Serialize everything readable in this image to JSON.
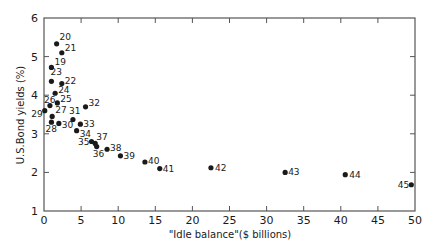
{
  "chart_data": {
    "type": "scatter",
    "title": "",
    "xlabel": "\"Idle balance\"($ billions)",
    "ylabel": "U.S.Bond yields (%)",
    "xlim": [
      0,
      50
    ],
    "ylim": [
      1,
      6
    ],
    "xticks": [
      0,
      5,
      10,
      15,
      20,
      25,
      30,
      35,
      40,
      45,
      50
    ],
    "yticks": [
      1,
      2,
      3,
      4,
      5,
      6
    ],
    "grid": false,
    "legend": null,
    "series": [
      {
        "name": "Observations (labelled by year)",
        "points": [
          {
            "label": "19",
            "x": 1.0,
            "y": 4.72
          },
          {
            "label": "20",
            "x": 1.7,
            "y": 5.33
          },
          {
            "label": "21",
            "x": 2.4,
            "y": 5.1
          },
          {
            "label": "22",
            "x": 2.4,
            "y": 4.3
          },
          {
            "label": "23",
            "x": 1.0,
            "y": 4.36
          },
          {
            "label": "24",
            "x": 1.5,
            "y": 4.05
          },
          {
            "label": "25",
            "x": 1.8,
            "y": 3.8
          },
          {
            "label": "26",
            "x": 0.8,
            "y": 3.73
          },
          {
            "label": "27",
            "x": 1.1,
            "y": 3.45
          },
          {
            "label": "28",
            "x": 1.0,
            "y": 3.3
          },
          {
            "label": "29",
            "x": 0.1,
            "y": 3.6
          },
          {
            "label": "30",
            "x": 2.0,
            "y": 3.27
          },
          {
            "label": "31",
            "x": 3.9,
            "y": 3.37
          },
          {
            "label": "32",
            "x": 5.6,
            "y": 3.7
          },
          {
            "label": "33",
            "x": 4.9,
            "y": 3.25
          },
          {
            "label": "34",
            "x": 4.4,
            "y": 3.08
          },
          {
            "label": "35",
            "x": 6.4,
            "y": 2.8
          },
          {
            "label": "36",
            "x": 7.1,
            "y": 2.67
          },
          {
            "label": "37",
            "x": 6.9,
            "y": 2.75
          },
          {
            "label": "38",
            "x": 8.5,
            "y": 2.6
          },
          {
            "label": "39",
            "x": 10.3,
            "y": 2.43
          },
          {
            "label": "40",
            "x": 13.6,
            "y": 2.27
          },
          {
            "label": "41",
            "x": 15.6,
            "y": 2.1
          },
          {
            "label": "42",
            "x": 22.5,
            "y": 2.12
          },
          {
            "label": "43",
            "x": 32.5,
            "y": 2.0
          },
          {
            "label": "44",
            "x": 40.6,
            "y": 1.94
          },
          {
            "label": "45",
            "x": 49.5,
            "y": 1.68
          }
        ]
      }
    ]
  },
  "label_offsets": {
    "19": [
      3,
      -2,
      "start"
    ],
    "20": [
      3,
      -4,
      "start"
    ],
    "21": [
      3,
      -2,
      "start"
    ],
    "22": [
      3,
      0,
      "start"
    ],
    "23": [
      -1,
      -6,
      "start"
    ],
    "24": [
      3,
      0,
      "start"
    ],
    "25": [
      3,
      -1,
      "start"
    ],
    "26": [
      -6,
      -3,
      "start"
    ],
    "27": [
      3,
      -3,
      "start"
    ],
    "28": [
      -6,
      10,
      "start"
    ],
    "29": [
      -2,
      6,
      "end"
    ],
    "30": [
      3,
      5,
      "start"
    ],
    "31": [
      -4,
      -6,
      "start"
    ],
    "32": [
      3,
      -1,
      "start"
    ],
    "33": [
      3,
      3,
      "start"
    ],
    "34": [
      3,
      6,
      "start"
    ],
    "35": [
      -2,
      3,
      "end"
    ],
    "36": [
      -4,
      10,
      "start"
    ],
    "37": [
      1,
      -3,
      "start"
    ],
    "38": [
      3,
      2,
      "start"
    ],
    "39": [
      3,
      3,
      "start"
    ],
    "40": [
      3,
      2,
      "start"
    ],
    "41": [
      3,
      3,
      "start"
    ],
    "42": [
      4,
      3,
      "start"
    ],
    "43": [
      3,
      3,
      "start"
    ],
    "44": [
      4,
      3,
      "start"
    ],
    "45": [
      -2,
      3,
      "end"
    ]
  },
  "colors": {
    "ink": "#1a1a1a",
    "background": "#ffffff",
    "axis": "#555555"
  }
}
